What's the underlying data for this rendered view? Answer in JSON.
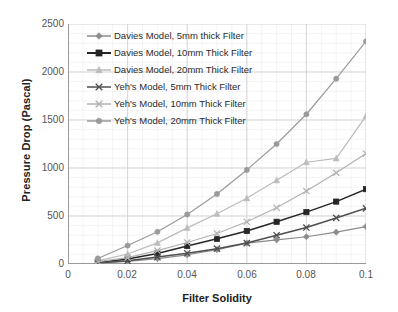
{
  "chart_data": {
    "type": "line",
    "title": "",
    "xlabel": "Filter Solidity",
    "ylabel": "Pressure Drop (Pascal)",
    "x": [
      0.01,
      0.02,
      0.03,
      0.04,
      0.05,
      0.06,
      0.07,
      0.08,
      0.09,
      0.1
    ],
    "xlim": [
      0,
      0.1
    ],
    "ylim": [
      0,
      2500
    ],
    "xticks": [
      "0",
      "0.02",
      "0.04",
      "0.06",
      "0.08",
      "0.1"
    ],
    "xtick_values": [
      0,
      0.02,
      0.04,
      0.06,
      0.08,
      0.1
    ],
    "yticks": [
      "0",
      "500",
      "1000",
      "1500",
      "2000",
      "2500"
    ],
    "ytick_values": [
      0,
      500,
      1000,
      1500,
      2000,
      2500
    ],
    "grid": true,
    "minor_grid": true,
    "legend_position": "upper-left-inside",
    "series": [
      {
        "name": "Davies Model, 5mm thick Filter",
        "marker": "diamond",
        "color": "#8c8c8c",
        "values": [
          10,
          28,
          56,
          96,
          150,
          218,
          252,
          284,
          332,
          390
        ]
      },
      {
        "name": "Davies Model, 10mm Thick Filter",
        "marker": "square",
        "color": "#262626",
        "values": [
          16,
          52,
          110,
          188,
          262,
          344,
          440,
          540,
          650,
          780
        ]
      },
      {
        "name": "Davies Model, 20mm Thick Filter",
        "marker": "triangle",
        "color": "#bcbcbc",
        "values": [
          32,
          104,
          220,
          376,
          524,
          684,
          872,
          1060,
          1100,
          1540
        ]
      },
      {
        "name": "Yeh's Model, 5mm Thick Filter",
        "marker": "cross",
        "color": "#4f4f4f",
        "values": [
          12,
          34,
          72,
          112,
          160,
          218,
          300,
          380,
          480,
          580
        ]
      },
      {
        "name": "Yeh's Model, 10mm Thick Filter",
        "marker": "cross",
        "color": "#b2b2b2",
        "values": [
          24,
          66,
          140,
          224,
          318,
          440,
          586,
          760,
          950,
          1150
        ]
      },
      {
        "name": "Yeh's Model, 20mm Thick Filter",
        "marker": "circle",
        "color": "#9a9a9a",
        "values": [
          58,
          192,
          336,
          516,
          730,
          980,
          1250,
          1560,
          1930,
          2320
        ]
      }
    ]
  }
}
